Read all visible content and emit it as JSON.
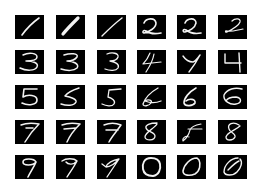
{
  "figure": {
    "rows": 5,
    "cols": 6,
    "background": "#ffffff",
    "tile_color": "#000000",
    "stroke_color": "#f2f2f2"
  },
  "tiles": [
    {
      "digit": "1",
      "row": 0,
      "col": 0,
      "path": "M7,20 C12,13 17,8 24,3",
      "w": 1.6
    },
    {
      "digit": "1",
      "row": 0,
      "col": 1,
      "path": "M7,19 C11,14 16,9 22,3",
      "w": 3.2
    },
    {
      "digit": "1",
      "row": 0,
      "col": 2,
      "path": "M5,21 C11,15 17,9 25,3",
      "w": 1.4
    },
    {
      "digit": "2",
      "row": 0,
      "col": 3,
      "path": "M7,8 C9,3 18,2 19,8 C19,13 12,17 7,18 C5,18 6,14 9,16 C13,19 19,19 24,18",
      "w": 1.6
    },
    {
      "digit": "2",
      "row": 0,
      "col": 4,
      "path": "M8,8 C10,3 19,2 19,8 C18,13 12,16 8,17 C5,17 6,13 9,15 C13,18 19,19 24,18",
      "w": 1.6
    },
    {
      "digit": "2",
      "row": 0,
      "col": 5,
      "path": "M14,6 C17,3 23,3 22,7 C21,10 15,14 9,17 C7,18 7,15 9,16 C14,17 19,15 25,14",
      "w": 1.2
    },
    {
      "digit": "3",
      "row": 1,
      "col": 0,
      "path": "M8,5 C14,2 22,3 22,7 C22,10 16,11 11,11 C18,11 24,13 22,17 C20,21 11,21 5,18",
      "w": 1.5
    },
    {
      "digit": "3",
      "row": 1,
      "col": 1,
      "path": "M8,5 C14,3 23,3 21,7 C19,10 14,11 11,11 C17,11 24,14 21,18 C18,21 11,21 5,19",
      "w": 1.5
    },
    {
      "digit": "3",
      "row": 1,
      "col": 2,
      "path": "M10,4 C15,2 22,3 21,7 C20,10 16,11 13,11 C18,12 23,14 21,18 C19,21 13,21 8,19",
      "w": 1.3
    },
    {
      "digit": "4",
      "row": 1,
      "col": 3,
      "path": "M13,3 C11,8 8,12 6,14 L24,12 M17,4 C16,10 13,16 9,22",
      "w": 1.2
    },
    {
      "digit": "4",
      "row": 1,
      "col": 4,
      "path": "M6,6 C8,9 12,12 16,12 C19,11 21,8 23,5 M23,5 C20,11 16,17 12,22",
      "w": 1.4
    },
    {
      "digit": "4",
      "row": 1,
      "col": 5,
      "path": "M7,4 L7,13 L23,13 M21,3 L22,22",
      "w": 1.4
    },
    {
      "digit": "5",
      "row": 2,
      "col": 0,
      "path": "M22,4 L9,4 L8,12 C13,9 22,10 22,15 C22,20 13,21 7,18",
      "w": 1.6
    },
    {
      "digit": "5",
      "row": 2,
      "col": 1,
      "path": "M23,3 C17,5 11,8 9,11 C14,12 21,14 20,17 C18,21 11,21 5,19",
      "w": 1.5
    },
    {
      "digit": "5",
      "row": 2,
      "col": 2,
      "path": "M24,4 L12,5 L11,12 C15,13 19,16 17,19 C15,22 9,21 5,19",
      "w": 1.3
    },
    {
      "digit": "6",
      "row": 3,
      "col": 3,
      "path": "M21,3 C14,7 8,13 6,19 C6,22 12,21 14,18 C16,15 11,14 8,16 C13,18 19,18 24,16",
      "w": 1.3
    },
    {
      "digit": "6",
      "row": 3,
      "col": 4,
      "path": "M19,3 C12,7 7,13 7,18 C8,22 16,21 18,18 C19,14 12,13 9,16",
      "w": 1.6
    },
    {
      "digit": "6",
      "row": 3,
      "col": 5,
      "path": "M24,4 C17,2 9,4 6,10 C5,16 12,20 18,19 C24,18 24,13 18,12 C13,12 9,14 8,16",
      "w": 1.4
    },
    {
      "digit": "7",
      "row": 4,
      "col": 0,
      "path": "M6,5 C11,3 18,3 24,4 C19,9 14,15 10,22 M11,8 L18,8",
      "w": 1.5
    },
    {
      "digit": "7",
      "row": 4,
      "col": 1,
      "path": "M6,5 C11,3 19,3 24,4 C19,9 14,15 11,22 M8,9 L20,8",
      "w": 1.5
    },
    {
      "digit": "7",
      "row": 4,
      "col": 2,
      "path": "M7,5 C12,3 19,3 24,5 C20,11 15,16 12,22 M9,10 L21,10",
      "w": 1.5
    },
    {
      "digit": "8",
      "row": 5,
      "col": 3,
      "path": "M20,3 C13,3 8,5 9,8 C10,12 18,12 18,16 C18,21 8,21 8,17 C8,12 17,9 20,4",
      "w": 1.3
    },
    {
      "digit": "8",
      "row": 5,
      "col": 4,
      "path": "M24,4 C18,5 14,7 13,10 C12,14 10,18 6,21 C5,18 9,15 12,17 M11,9 L25,9",
      "w": 1.1
    },
    {
      "digit": "8",
      "row": 5,
      "col": 5,
      "path": "M21,5 C15,1 9,4 11,9 C12,13 18,13 17,17 C15,21 8,21 8,17 C9,12 18,10 22,6",
      "w": 1.3
    },
    {
      "digit": "9",
      "row": 6,
      "col": 0,
      "path": "M21,7 C19,3 8,3 8,7 C8,11 18,11 21,7 C19,12 16,16 13,22",
      "w": 1.6
    },
    {
      "digit": "9",
      "row": 6,
      "col": 1,
      "path": "M6,6 C10,3 18,3 21,6 C18,10 12,10 10,7 M21,6 C18,12 14,17 11,22",
      "w": 1.4
    },
    {
      "digit": "9",
      "row": 6,
      "col": 2,
      "path": "M22,4 C16,5 10,8 9,12 C13,12 19,8 22,4 C18,10 14,16 10,22 M5,9 L9,12",
      "w": 1.3
    },
    {
      "digit": "0",
      "row": 6,
      "col": 3,
      "path": "M14,3 C7,3 5,9 6,14 C7,20 12,21 16,21 C22,20 24,14 23,9 C22,4 18,3 14,3 Z",
      "w": 1.9
    },
    {
      "digit": "0",
      "row": 6,
      "col": 4,
      "path": "M20,3 C13,3 7,10 6,16 C6,21 13,21 18,19 C23,16 24,9 22,5 C21,4 20,3 20,3",
      "w": 1.6
    },
    {
      "digit": "0",
      "row": 6,
      "col": 5,
      "path": "M20,3 C13,3 6,10 6,17 C7,21 15,21 19,17 C23,13 25,7 22,4 M10,15 C14,11 18,7 21,6",
      "w": 1.4
    }
  ]
}
